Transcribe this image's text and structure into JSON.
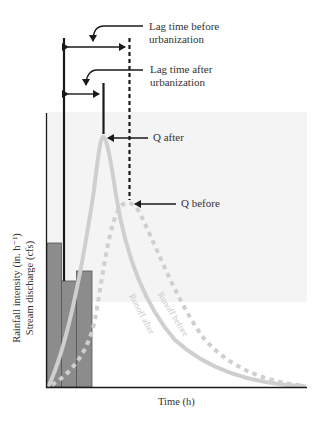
{
  "figure": {
    "annotations": {
      "lag_before": [
        "Lag time before",
        "urbanization"
      ],
      "lag_after": [
        "Lag time after",
        "urbanization"
      ],
      "q_after": "Q after",
      "q_before": "Q before"
    },
    "axes": {
      "ylabel_line1": "Rainfall intensity (in. h⁻¹)",
      "ylabel_line2": "Stream discharge (cfs)",
      "xlabel": "Time (h)"
    },
    "curve_labels": {
      "runoff_before": "Runoff before",
      "runoff_after": "Runoff after"
    },
    "colors": {
      "axis": "#1a1a1a",
      "bars_fill": "#8c8c8c",
      "bars_stroke": "#555555",
      "runoff_curves": "#cfcfcf",
      "shaded_region": "#f3f3f3"
    },
    "rainfall_bars": [
      {
        "index": 1,
        "relative_height": 0.53
      },
      {
        "index": 2,
        "relative_height": 0.39
      },
      {
        "index": 3,
        "relative_height": 0.43
      }
    ]
  }
}
